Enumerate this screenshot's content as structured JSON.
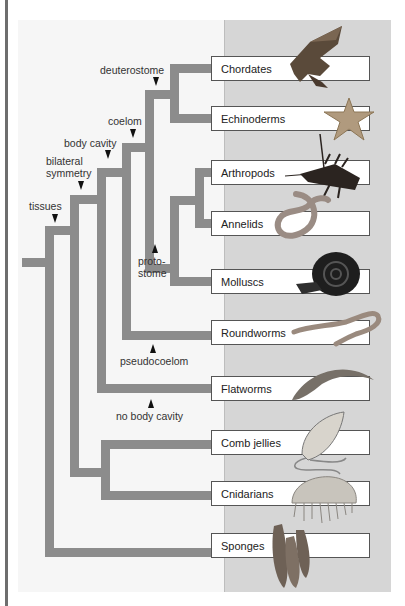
{
  "diagram": {
    "colors": {
      "branch": "#8c8c8c",
      "panel": "#d6d6d6",
      "box_border": "#555555",
      "arrow": "#111111"
    },
    "nodes": [
      {
        "id": "tissues",
        "label": "tissues"
      },
      {
        "id": "bilateral",
        "label_line1": "bilateral",
        "label_line2": "symmetry"
      },
      {
        "id": "body_cavity",
        "label": "body cavity"
      },
      {
        "id": "coelom",
        "label": "coelom"
      },
      {
        "id": "deuterostome",
        "label": "deuterostome"
      },
      {
        "id": "protostome",
        "label_line1": "proto-",
        "label_line2": "stome"
      },
      {
        "id": "pseudocoelom",
        "label": "pseudocoelom"
      },
      {
        "id": "no_body_cavity",
        "label": "no body cavity"
      }
    ],
    "taxa": [
      {
        "label": "Chordates",
        "icon": "hawk-icon"
      },
      {
        "label": "Echinoderms",
        "icon": "sea-star-icon"
      },
      {
        "label": "Arthropods",
        "icon": "lobster-icon"
      },
      {
        "label": "Annelids",
        "icon": "earthworm-icon"
      },
      {
        "label": "Molluscs",
        "icon": "snail-icon"
      },
      {
        "label": "Roundworms",
        "icon": "roundworm-icon"
      },
      {
        "label": "Flatworms",
        "icon": "flatworm-icon"
      },
      {
        "label": "Comb jellies",
        "icon": "comb-jelly-icon"
      },
      {
        "label": "Cnidarians",
        "icon": "jellyfish-icon"
      },
      {
        "label": "Sponges",
        "icon": "sponge-icon"
      }
    ]
  }
}
